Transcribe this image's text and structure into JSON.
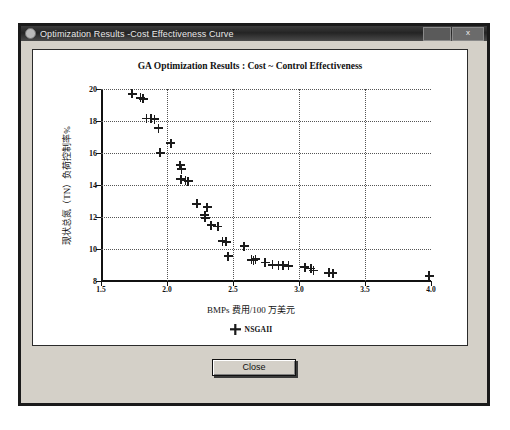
{
  "window": {
    "title": "Optimization Results -Cost Effectiveness Curve",
    "icon": "app-icon",
    "minimize_label": "",
    "maximize_label": "",
    "close_label": "x"
  },
  "footer": {
    "close_button_label": "Close"
  },
  "chart_data": {
    "type": "scatter",
    "title": "GA Optimization Results : Cost ~ Control Effectiveness",
    "xlabel": "BMPs 费用/100 万美元",
    "ylabel": "现状总氮（TN）负荷控制率%",
    "xlim": [
      1.5,
      4.0
    ],
    "ylim": [
      8,
      20
    ],
    "xticks": [
      "1.5",
      "2.0",
      "2.5",
      "3.0",
      "3.5",
      "4.0"
    ],
    "xtick_values": [
      1.5,
      2.0,
      2.5,
      3.0,
      3.5,
      4.0
    ],
    "yticks": [
      "8",
      "10",
      "12",
      "14",
      "16",
      "18",
      "20"
    ],
    "ytick_values": [
      8,
      10,
      12,
      14,
      16,
      18,
      20
    ],
    "grid": true,
    "grid_style": "dotted",
    "legend_position": "bottom-center",
    "marker": "plus",
    "marker_color": "#1b1b1b",
    "series": [
      {
        "name": "NSGAII",
        "points": [
          [
            1.735,
            19.7
          ],
          [
            1.8,
            19.45
          ],
          [
            1.82,
            19.38
          ],
          [
            1.845,
            18.15
          ],
          [
            1.88,
            18.15
          ],
          [
            1.905,
            18.12
          ],
          [
            1.935,
            17.55
          ],
          [
            1.95,
            16.02
          ],
          [
            2.03,
            16.62
          ],
          [
            2.1,
            15.25
          ],
          [
            2.11,
            15.0
          ],
          [
            2.105,
            14.35
          ],
          [
            2.14,
            14.28
          ],
          [
            2.16,
            14.25
          ],
          [
            2.225,
            12.82
          ],
          [
            2.305,
            12.62
          ],
          [
            2.285,
            12.12
          ],
          [
            2.29,
            11.95
          ],
          [
            2.335,
            11.5
          ],
          [
            2.385,
            11.4
          ],
          [
            2.42,
            10.48
          ],
          [
            2.45,
            10.45
          ],
          [
            2.465,
            9.55
          ],
          [
            2.585,
            10.18
          ],
          [
            2.64,
            9.32
          ],
          [
            2.655,
            9.28
          ],
          [
            2.67,
            9.35
          ],
          [
            2.745,
            9.15
          ],
          [
            2.8,
            9.02
          ],
          [
            2.845,
            9.0
          ],
          [
            2.88,
            8.98
          ],
          [
            2.92,
            8.95
          ],
          [
            3.045,
            8.85
          ],
          [
            3.09,
            8.78
          ],
          [
            3.11,
            8.65
          ],
          [
            3.225,
            8.52
          ],
          [
            3.255,
            8.5
          ],
          [
            3.985,
            8.32
          ]
        ]
      }
    ]
  }
}
